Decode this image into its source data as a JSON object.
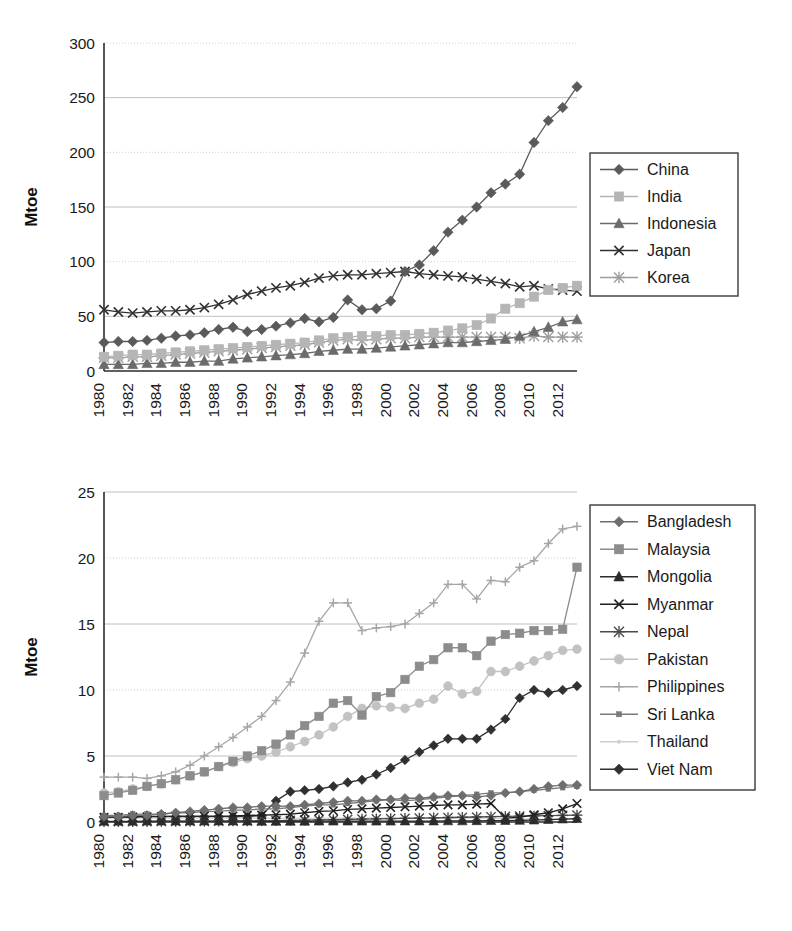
{
  "figure": {
    "panels": [
      {
        "id": "top",
        "axis_title": "Mtoe",
        "y_ticks": [
          "0",
          "50",
          "100",
          "150",
          "200",
          "250",
          "300"
        ],
        "x_ticks": [
          "1980",
          "1982",
          "1984",
          "1986",
          "1988",
          "1990",
          "1992",
          "1994",
          "1996",
          "1998",
          "2000",
          "2002",
          "2004",
          "2006",
          "2008",
          "2010",
          "2012"
        ],
        "legend_labels": [
          "China",
          "India",
          "Indonesia",
          "Japan",
          "Korea"
        ]
      },
      {
        "id": "bottom",
        "axis_title": "Mtoe",
        "y_ticks": [
          "0",
          "5",
          "10",
          "15",
          "20",
          "25"
        ],
        "x_ticks": [
          "1980",
          "1982",
          "1984",
          "1986",
          "1988",
          "1990",
          "1992",
          "1994",
          "1996",
          "1998",
          "2000",
          "2002",
          "2004",
          "2006",
          "2008",
          "2010",
          "2012"
        ],
        "legend_labels": [
          "Bangladesh",
          "Malaysia",
          "Mongolia",
          "Myanmar",
          "Nepal",
          "Pakistan",
          "Philippines",
          "Sri Lanka",
          "Thailand",
          "Viet Nam"
        ]
      }
    ]
  },
  "chart_data": [
    {
      "type": "line",
      "panel": "top",
      "title": "",
      "xlabel": "",
      "ylabel": "Mtoe",
      "xlim": [
        1980,
        2013
      ],
      "ylim": [
        0,
        300
      ],
      "y_ticks": [
        0,
        50,
        100,
        150,
        200,
        250,
        300
      ],
      "grid": true,
      "legend_position": "right-outside",
      "x": [
        1980,
        1981,
        1982,
        1983,
        1984,
        1985,
        1986,
        1987,
        1988,
        1989,
        1990,
        1991,
        1992,
        1993,
        1994,
        1995,
        1996,
        1997,
        1998,
        1999,
        2000,
        2001,
        2002,
        2003,
        2004,
        2005,
        2006,
        2007,
        2008,
        2009,
        2010,
        2011,
        2012,
        2013
      ],
      "series": [
        {
          "name": "China",
          "marker": "diamond",
          "color": "#5a5a5a",
          "values": [
            26,
            27,
            27,
            28,
            30,
            32,
            33,
            35,
            38,
            40,
            36,
            38,
            41,
            44,
            48,
            45,
            49,
            65,
            56,
            57,
            64,
            91,
            97,
            110,
            127,
            138,
            150,
            163,
            171,
            180,
            209,
            229,
            241,
            260
          ]
        },
        {
          "name": "India",
          "marker": "square",
          "color": "#b5b5b5",
          "values": [
            13,
            14,
            15,
            15,
            16,
            17,
            18,
            19,
            20,
            21,
            22,
            23,
            24,
            25,
            26,
            28,
            30,
            31,
            32,
            32,
            33,
            33,
            34,
            35,
            37,
            39,
            42,
            48,
            57,
            62,
            68,
            74,
            76,
            78
          ]
        },
        {
          "name": "Indonesia",
          "marker": "triangle",
          "color": "#6b6b6b",
          "values": [
            6,
            6,
            6,
            7,
            7,
            8,
            8,
            9,
            9,
            11,
            12,
            13,
            14,
            15,
            16,
            18,
            19,
            20,
            20,
            21,
            22,
            23,
            24,
            25,
            26,
            26,
            27,
            28,
            29,
            32,
            36,
            40,
            45,
            47
          ]
        },
        {
          "name": "Japan",
          "marker": "x",
          "color": "#303030",
          "values": [
            56,
            54,
            53,
            54,
            55,
            55,
            56,
            58,
            61,
            65,
            70,
            73,
            76,
            78,
            81,
            85,
            87,
            88,
            88,
            89,
            90,
            91,
            89,
            88,
            87,
            86,
            84,
            82,
            80,
            77,
            78,
            75,
            74,
            73
          ]
        },
        {
          "name": "Korea",
          "marker": "star",
          "color": "#9d9d9d",
          "values": [
            12,
            12,
            13,
            13,
            14,
            15,
            16,
            17,
            18,
            19,
            20,
            21,
            22,
            23,
            24,
            26,
            28,
            29,
            28,
            29,
            30,
            30,
            31,
            31,
            31,
            31,
            31,
            31,
            31,
            30,
            32,
            31,
            31,
            31
          ]
        }
      ]
    },
    {
      "type": "line",
      "panel": "bottom",
      "title": "",
      "xlabel": "",
      "ylabel": "Mtoe",
      "xlim": [
        1980,
        2013
      ],
      "ylim": [
        0,
        25
      ],
      "y_ticks": [
        0,
        5,
        10,
        15,
        20,
        25
      ],
      "grid": true,
      "legend_position": "right-outside",
      "x": [
        1980,
        1981,
        1982,
        1983,
        1984,
        1985,
        1986,
        1987,
        1988,
        1989,
        1990,
        1991,
        1992,
        1993,
        1994,
        1995,
        1996,
        1997,
        1998,
        1999,
        2000,
        2001,
        2002,
        2003,
        2004,
        2005,
        2006,
        2007,
        2008,
        2009,
        2010,
        2011,
        2012,
        2013
      ],
      "series": [
        {
          "name": "Bangladesh",
          "marker": "diamond",
          "color": "#6e6e6e",
          "values": [
            0.4,
            0.4,
            0.5,
            0.5,
            0.6,
            0.7,
            0.8,
            0.9,
            1.0,
            1.1,
            1.1,
            1.2,
            1.2,
            1.2,
            1.3,
            1.4,
            1.5,
            1.6,
            1.6,
            1.7,
            1.7,
            1.8,
            1.8,
            1.9,
            2.0,
            2.0,
            1.9,
            2.0,
            2.2,
            2.3,
            2.5,
            2.7,
            2.8,
            2.8
          ]
        },
        {
          "name": "Malaysia",
          "marker": "square",
          "color": "#8c8c8c",
          "values": [
            2.0,
            2.2,
            2.4,
            2.7,
            2.9,
            3.2,
            3.5,
            3.8,
            4.2,
            4.6,
            5.0,
            5.4,
            5.9,
            6.6,
            7.3,
            8.0,
            9.0,
            9.2,
            8.1,
            9.5,
            9.8,
            10.8,
            11.8,
            12.3,
            13.2,
            13.2,
            12.6,
            13.7,
            14.2,
            14.3,
            14.5,
            14.5,
            14.6,
            19.3
          ]
        },
        {
          "name": "Mongolia",
          "marker": "triangle",
          "color": "#2b2b2b",
          "values": [
            0.05,
            0.05,
            0.05,
            0.06,
            0.06,
            0.06,
            0.07,
            0.07,
            0.07,
            0.07,
            0.06,
            0.05,
            0.05,
            0.05,
            0.05,
            0.06,
            0.06,
            0.06,
            0.06,
            0.06,
            0.06,
            0.07,
            0.07,
            0.07,
            0.08,
            0.08,
            0.09,
            0.1,
            0.11,
            0.12,
            0.14,
            0.18,
            0.22,
            0.25
          ]
        },
        {
          "name": "Myanmar",
          "marker": "x",
          "color": "#1f1f1f",
          "values": [
            0.35,
            0.36,
            0.38,
            0.4,
            0.42,
            0.44,
            0.45,
            0.45,
            0.45,
            0.46,
            0.5,
            0.52,
            0.55,
            0.6,
            0.7,
            0.8,
            0.85,
            0.95,
            1.0,
            1.05,
            1.1,
            1.15,
            1.2,
            1.25,
            1.3,
            1.3,
            1.35,
            1.4,
            0.3,
            0.35,
            0.55,
            0.7,
            1.0,
            1.4
          ]
        },
        {
          "name": "Nepal",
          "marker": "star",
          "color": "#4a4a4a",
          "values": [
            0.02,
            0.02,
            0.03,
            0.03,
            0.04,
            0.04,
            0.05,
            0.05,
            0.06,
            0.07,
            0.08,
            0.09,
            0.1,
            0.12,
            0.14,
            0.16,
            0.18,
            0.2,
            0.22,
            0.24,
            0.26,
            0.28,
            0.3,
            0.32,
            0.34,
            0.36,
            0.38,
            0.4,
            0.42,
            0.44,
            0.46,
            0.48,
            0.5,
            0.52
          ]
        },
        {
          "name": "Pakistan",
          "marker": "circle",
          "color": "#c2c2c2",
          "values": [
            2.2,
            2.3,
            2.5,
            2.7,
            2.9,
            3.2,
            3.5,
            3.8,
            4.2,
            4.5,
            4.8,
            5.0,
            5.3,
            5.7,
            6.1,
            6.6,
            7.2,
            8.0,
            8.6,
            8.8,
            8.7,
            8.6,
            9.0,
            9.3,
            10.3,
            9.7,
            9.9,
            11.4,
            11.4,
            11.8,
            12.2,
            12.6,
            13.0,
            13.1
          ]
        },
        {
          "name": "Philippines",
          "marker": "plus",
          "color": "#a6a6a6",
          "values": [
            3.4,
            3.4,
            3.4,
            3.3,
            3.5,
            3.8,
            4.3,
            5.0,
            5.7,
            6.4,
            7.2,
            8.0,
            9.2,
            10.6,
            12.8,
            15.2,
            16.6,
            16.6,
            14.5,
            14.7,
            14.8,
            15.0,
            15.8,
            16.6,
            18.0,
            18.0,
            16.9,
            18.3,
            18.2,
            19.3,
            19.8,
            21.1,
            22.2,
            22.4
          ]
        },
        {
          "name": "Sri Lanka",
          "marker": "smallsquare",
          "color": "#7a7a7a",
          "values": [
            0.5,
            0.5,
            0.6,
            0.6,
            0.6,
            0.7,
            0.7,
            0.8,
            0.8,
            0.9,
            0.9,
            1.0,
            1.0,
            1.1,
            1.2,
            1.3,
            1.3,
            1.4,
            1.5,
            1.6,
            1.7,
            1.6,
            1.7,
            1.8,
            1.9,
            2.0,
            2.1,
            2.2,
            2.2,
            2.3,
            2.4,
            2.5,
            2.6,
            2.7
          ]
        },
        {
          "name": "Thailand",
          "marker": "dot",
          "color": "#cfcfcf",
          "values": [
            0.3,
            0.3,
            0.3,
            0.3,
            0.3,
            0.3,
            0.3,
            0.3,
            0.3,
            0.3,
            0.3,
            0.3,
            0.3,
            0.3,
            0.3,
            0.3,
            0.3,
            0.3,
            0.3,
            0.3,
            0.3,
            0.3,
            0.3,
            0.3,
            0.3,
            0.3,
            0.3,
            0.3,
            0.25,
            0.25,
            0.2,
            0.2,
            0.2,
            0.2
          ]
        },
        {
          "name": "Viet Nam",
          "marker": "diamond",
          "color": "#303030",
          "values": [
            0.4,
            0.4,
            0.4,
            0.4,
            0.4,
            0.4,
            0.4,
            0.4,
            0.4,
            0.4,
            0.4,
            0.5,
            1.6,
            2.3,
            2.4,
            2.5,
            2.7,
            3.0,
            3.2,
            3.6,
            4.1,
            4.7,
            5.3,
            5.8,
            6.3,
            6.3,
            6.3,
            7.0,
            7.8,
            9.4,
            10.0,
            9.8,
            10.0,
            10.3
          ]
        }
      ]
    }
  ]
}
